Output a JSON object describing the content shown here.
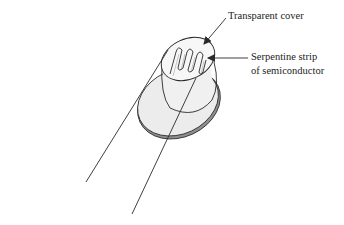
{
  "diagram": {
    "labels": {
      "cover": "Transparent cover",
      "strip_line1": "Serpentine strip",
      "strip_line2": "of semiconductor"
    },
    "colors": {
      "stroke": "#2a2a2a",
      "fill": "#ececec",
      "rim": "#9a9a9a",
      "background": "#ffffff"
    }
  }
}
